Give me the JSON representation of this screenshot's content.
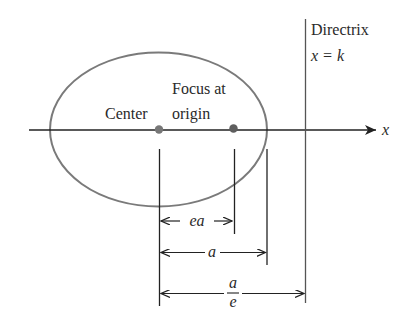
{
  "diagram": {
    "labels": {
      "directrix_title": "Directrix",
      "directrix_eq": "x = k",
      "focus_line1": "Focus at",
      "focus_line2": "origin",
      "center": "Center",
      "axis_x": "x",
      "dim_ea": "ea",
      "dim_a": "a",
      "dim_a_over_e_num": "a",
      "dim_a_over_e_den": "e"
    },
    "geometry": {
      "ellipse": {
        "cx": 158.5,
        "cy": 129.5,
        "rx": 108.5,
        "ry": 77
      },
      "center_point": {
        "x": 159,
        "y": 129.5
      },
      "focus_point": {
        "x": 233,
        "y": 129.5
      },
      "vertex_x": 267,
      "directrix_x": 305,
      "axis": {
        "x1": 29,
        "x2": 376,
        "y": 130
      }
    },
    "dimensions": [
      {
        "label": "ea",
        "from": "center",
        "to": "focus"
      },
      {
        "label": "a",
        "from": "center",
        "to": "vertex"
      },
      {
        "label": "a/e",
        "from": "center",
        "to": "directrix"
      }
    ],
    "colors": {
      "line": "#222222",
      "ellipse": "#7a7a7a",
      "point": "#6a6a6a",
      "text": "#2a2a2a"
    }
  }
}
